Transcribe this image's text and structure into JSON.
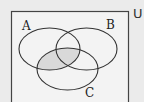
{
  "diagram": {
    "type": "venn",
    "universe": {
      "label": "U"
    },
    "sets": [
      {
        "id": "A",
        "label": "A"
      },
      {
        "id": "B",
        "label": "B"
      },
      {
        "id": "C",
        "label": "C"
      }
    ],
    "shaded_region": "A ∩ C",
    "colors": {
      "background": "#ebebeb",
      "universe_fill": "#f3f3f3",
      "stroke": "#333333",
      "shade": "#d9d9d9"
    }
  }
}
